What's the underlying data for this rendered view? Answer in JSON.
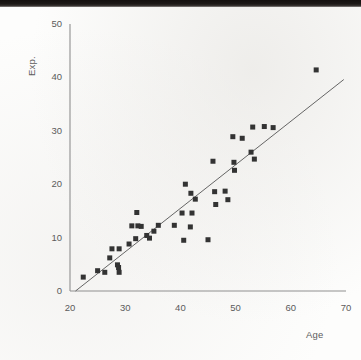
{
  "figure": {
    "kind": "scatter-plot-scan",
    "background_color": "#fdfdfc",
    "ink_color": "#3b3b3b",
    "axis_color": "#8f8f8f",
    "label_color": "#5b5b5b"
  },
  "chart_data": {
    "type": "scatter",
    "title": "",
    "xlabel": "Age",
    "ylabel": "Exp.",
    "xlim": [
      20,
      70
    ],
    "ylim": [
      0,
      50
    ],
    "xticks": [
      20,
      30,
      40,
      50,
      60,
      70
    ],
    "yticks": [
      0,
      10,
      20,
      30,
      40,
      50
    ],
    "xtick_labels": [
      "20",
      "30",
      "40",
      "50",
      "60",
      "70"
    ],
    "ytick_labels": [
      "0",
      "10",
      "20",
      "30",
      "40",
      "50"
    ],
    "grid": false,
    "legend": null,
    "marker": {
      "shape": "square",
      "color": "#333333",
      "size_px": 5
    },
    "points": [
      {
        "x": 22.4,
        "y": 2.6
      },
      {
        "x": 25.0,
        "y": 3.8
      },
      {
        "x": 26.3,
        "y": 3.5
      },
      {
        "x": 27.2,
        "y": 6.2
      },
      {
        "x": 27.6,
        "y": 7.9
      },
      {
        "x": 28.6,
        "y": 4.9
      },
      {
        "x": 28.8,
        "y": 4.4
      },
      {
        "x": 28.9,
        "y": 7.9
      },
      {
        "x": 28.9,
        "y": 3.5
      },
      {
        "x": 30.7,
        "y": 8.8
      },
      {
        "x": 31.2,
        "y": 12.2
      },
      {
        "x": 31.9,
        "y": 9.8
      },
      {
        "x": 32.1,
        "y": 14.7
      },
      {
        "x": 32.3,
        "y": 12.2
      },
      {
        "x": 32.9,
        "y": 12.1
      },
      {
        "x": 33.9,
        "y": 10.4
      },
      {
        "x": 34.4,
        "y": 9.9
      },
      {
        "x": 35.2,
        "y": 11.2
      },
      {
        "x": 36.0,
        "y": 12.3
      },
      {
        "x": 38.9,
        "y": 12.3
      },
      {
        "x": 40.3,
        "y": 14.6
      },
      {
        "x": 40.6,
        "y": 9.5
      },
      {
        "x": 40.9,
        "y": 20.0
      },
      {
        "x": 41.8,
        "y": 12.0
      },
      {
        "x": 41.9,
        "y": 18.3
      },
      {
        "x": 42.1,
        "y": 14.6
      },
      {
        "x": 42.7,
        "y": 17.2
      },
      {
        "x": 45.0,
        "y": 9.6
      },
      {
        "x": 45.9,
        "y": 24.3
      },
      {
        "x": 46.2,
        "y": 18.6
      },
      {
        "x": 46.4,
        "y": 16.2
      },
      {
        "x": 48.1,
        "y": 18.7
      },
      {
        "x": 48.6,
        "y": 17.1
      },
      {
        "x": 49.5,
        "y": 28.9
      },
      {
        "x": 49.7,
        "y": 24.1
      },
      {
        "x": 49.8,
        "y": 22.6
      },
      {
        "x": 51.2,
        "y": 28.6
      },
      {
        "x": 52.8,
        "y": 26.0
      },
      {
        "x": 53.1,
        "y": 30.7
      },
      {
        "x": 53.4,
        "y": 24.7
      },
      {
        "x": 55.2,
        "y": 30.8
      },
      {
        "x": 56.8,
        "y": 30.6
      },
      {
        "x": 64.6,
        "y": 41.4
      }
    ],
    "trendline": {
      "visible": true,
      "color": "#555555",
      "x_start": 21.0,
      "y_start": 0.0,
      "x_end": 69.6,
      "y_end": 39.6
    }
  }
}
